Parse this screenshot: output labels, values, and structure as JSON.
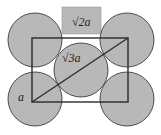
{
  "diagram": {
    "colors": {
      "circle_fill": "#b8b8b8",
      "stroke": "#2a2a2a",
      "label_box": "#b8b8b8"
    },
    "labels": {
      "top": "√2a",
      "middle": "√3a",
      "left": "a"
    }
  }
}
